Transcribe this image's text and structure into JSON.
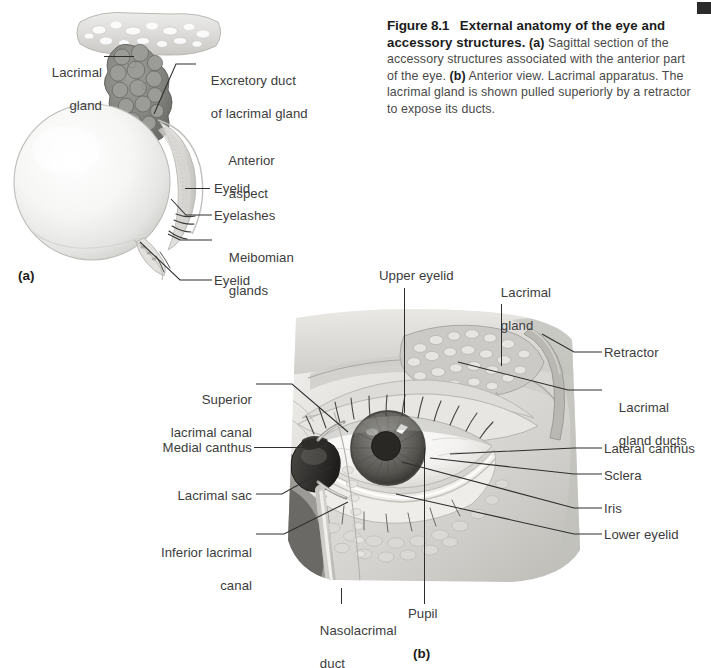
{
  "figure": {
    "number": "Figure 8.1",
    "title": "External anatomy of the eye and accessory structures.",
    "part_a_marker": "(a)",
    "part_a_text": " Sagittal section of the accessory structures associated with the anterior part of the eye. ",
    "part_b_marker": "(b)",
    "part_b_text": " Anterior view. Lacrimal apparatus. The lacrimal gland is shown pulled superiorly by a retractor to expose its ducts."
  },
  "panel_a": {
    "marker": "(a)",
    "labels": {
      "lacrimal_gland_l1": "Lacrimal",
      "lacrimal_gland_l2": "gland",
      "excretory_duct_l1": "Excretory duct",
      "excretory_duct_l2": "of lacrimal gland",
      "anterior_aspect_l1": "Anterior",
      "anterior_aspect_l2": "aspect",
      "eyelid_upper": "Eyelid",
      "eyelashes": "Eyelashes",
      "meibomian_l1": "Meibomian",
      "meibomian_l2": "glands",
      "eyelid_lower": "Eyelid"
    }
  },
  "panel_b": {
    "marker": "(b)",
    "labels": {
      "upper_eyelid": "Upper eyelid",
      "lacrimal_gland_l1": "Lacrimal",
      "lacrimal_gland_l2": "gland",
      "retractor": "Retractor",
      "lacrimal_gland_ducts_l1": "Lacrimal",
      "lacrimal_gland_ducts_l2": "gland ducts",
      "lateral_canthus": "Lateral canthus",
      "sclera": "Sclera",
      "iris": "Iris",
      "lower_eyelid": "Lower eyelid",
      "superior_canal_l1": "Superior",
      "superior_canal_l2": "lacrimal canal",
      "medial_canthus": "Medial canthus",
      "lacrimal_sac": "Lacrimal sac",
      "inferior_canal_l1": "Inferior lacrimal",
      "inferior_canal_l2": "canal",
      "nasolacrimal_duct_l1": "Nasolacrimal",
      "nasolacrimal_duct_l2": "duct",
      "pupil": "Pupil"
    }
  },
  "colors": {
    "text": "#3c3c3c",
    "heading": "#1c1c1c",
    "leader": "#2e2e2e",
    "page_bg": "#ffffff"
  }
}
